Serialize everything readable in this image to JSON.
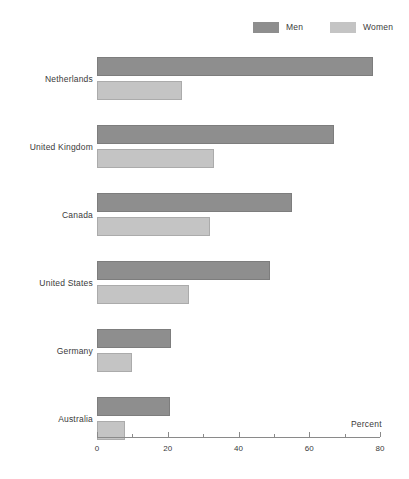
{
  "chart_data": {
    "type": "bar",
    "orientation": "horizontal",
    "title": "",
    "xlabel": "Percent",
    "ylabel": "",
    "xlim": [
      0,
      80
    ],
    "xticks": [
      0,
      20,
      40,
      60,
      80
    ],
    "xtick_labels": [
      "0",
      "20",
      "40",
      "60",
      "80"
    ],
    "minor_ticks": [
      10,
      30,
      50,
      70
    ],
    "grid": false,
    "legend_position": "top-right",
    "categories": [
      "Netherlands",
      "United Kingdom",
      "Canada",
      "United States",
      "Germany",
      "Australia"
    ],
    "series": [
      {
        "name": "Men",
        "color": "#8e8e8e",
        "values": [
          78,
          67,
          55,
          49,
          21,
          20.5
        ]
      },
      {
        "name": "Women",
        "color": "#c4c4c4",
        "values": [
          24,
          33,
          32,
          26,
          10,
          8
        ]
      }
    ]
  },
  "legend": {
    "items": [
      {
        "label": "Men",
        "color": "#8e8e8e"
      },
      {
        "label": "Women",
        "color": "#c4c4c4"
      }
    ]
  },
  "axis": {
    "title": "Percent",
    "tick_labels": [
      "0",
      "20",
      "40",
      "60",
      "80"
    ]
  },
  "colors": {
    "men": "#8e8e8e",
    "women": "#c4c4c4",
    "axis": "#8a8a8a",
    "text": "#3a3a3a",
    "background": "#ffffff"
  }
}
